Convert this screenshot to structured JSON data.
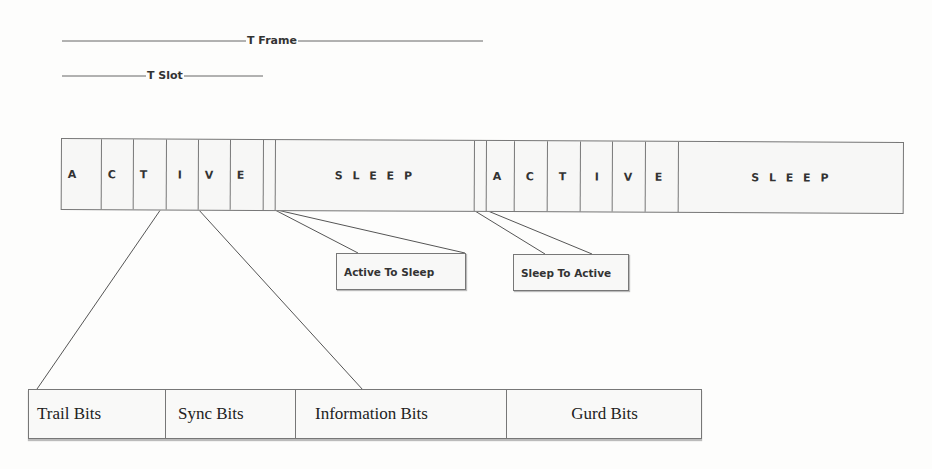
{
  "diagram": {
    "type": "TDMA frame structure (active/sleep duty cycle)",
    "dimensions": {
      "t_frame_label": "T Frame",
      "t_slot_label": "T Slot"
    },
    "frame": {
      "cells": [
        {
          "label": "A",
          "kind": "active-slot"
        },
        {
          "label": "C",
          "kind": "active-slot"
        },
        {
          "label": "T",
          "kind": "active-slot"
        },
        {
          "label": "I",
          "kind": "active-slot"
        },
        {
          "label": "V",
          "kind": "active-slot"
        },
        {
          "label": "E",
          "kind": "active-slot"
        },
        {
          "label": "",
          "kind": "transition"
        },
        {
          "label": "S L E E P",
          "kind": "sleep"
        },
        {
          "label": "",
          "kind": "transition"
        },
        {
          "label": "A",
          "kind": "active-slot"
        },
        {
          "label": "C",
          "kind": "active-slot"
        },
        {
          "label": "T",
          "kind": "active-slot"
        },
        {
          "label": "I",
          "kind": "active-slot"
        },
        {
          "label": "V",
          "kind": "active-slot"
        },
        {
          "label": "E",
          "kind": "active-slot"
        },
        {
          "label": "S L E E P",
          "kind": "sleep"
        }
      ]
    },
    "callouts": {
      "active_to_sleep": "Active To Sleep",
      "sleep_to_active": "Sleep To Active"
    },
    "slot_breakdown": {
      "fields": [
        {
          "label": "Trail Bits"
        },
        {
          "label": "Sync Bits"
        },
        {
          "label": "Information Bits"
        },
        {
          "label": "Gurd Bits"
        }
      ]
    },
    "colors": {
      "line": "#555555",
      "box_border": "#777777",
      "background": "#fdfdfc",
      "text": "#333333"
    }
  }
}
